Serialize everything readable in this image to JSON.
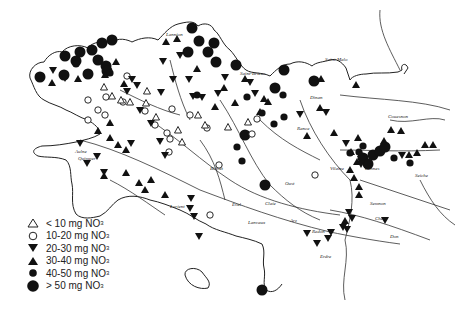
{
  "legend": {
    "items": [
      {
        "symbol": "triangle-open",
        "label": "< 10 mg NO",
        "sub": "3"
      },
      {
        "symbol": "circle-open",
        "label": "10-20 mg NO",
        "sub": "3"
      },
      {
        "symbol": "triangle-down-filled",
        "label": "20-30 mg NO",
        "sub": "3"
      },
      {
        "symbol": "triangle-up-filled",
        "label": "30-40 mg NO",
        "sub": "3"
      },
      {
        "symbol": "circle-small-filled",
        "label": "40-50 mg NO",
        "sub": "3"
      },
      {
        "symbol": "circle-large-filled",
        "label": "> 50 mg NO",
        "sub": "3"
      }
    ]
  },
  "map": {
    "river_labels": [
      {
        "text": "Lannion",
        "x": 166,
        "y": 36
      },
      {
        "text": "Saint-Brieuc",
        "x": 240,
        "y": 75
      },
      {
        "text": "Saint-Malo",
        "x": 325,
        "y": 61
      },
      {
        "text": "Dinan",
        "x": 310,
        "y": 99
      },
      {
        "text": "Rance",
        "x": 297,
        "y": 130
      },
      {
        "text": "Aulne",
        "x": 75,
        "y": 153
      },
      {
        "text": "Quimper",
        "x": 78,
        "y": 160
      },
      {
        "text": "Blavet",
        "x": 210,
        "y": 170
      },
      {
        "text": "Oust",
        "x": 285,
        "y": 185
      },
      {
        "text": "Vilaine",
        "x": 330,
        "y": 170
      },
      {
        "text": "Rennes",
        "x": 365,
        "y": 170
      },
      {
        "text": "Seiche",
        "x": 415,
        "y": 177
      },
      {
        "text": "Semnon",
        "x": 370,
        "y": 205
      },
      {
        "text": "Chère",
        "x": 375,
        "y": 220
      },
      {
        "text": "Don",
        "x": 390,
        "y": 238
      },
      {
        "text": "Erdre",
        "x": 320,
        "y": 258
      },
      {
        "text": "Claie",
        "x": 265,
        "y": 205
      },
      {
        "text": "Arz",
        "x": 290,
        "y": 222
      },
      {
        "text": "Redon",
        "x": 312,
        "y": 233
      },
      {
        "text": "Evel",
        "x": 232,
        "y": 206
      },
      {
        "text": "Lanvaux",
        "x": 248,
        "y": 224
      },
      {
        "text": "Lorient",
        "x": 170,
        "y": 208
      },
      {
        "text": "Couesnon",
        "x": 388,
        "y": 118
      }
    ],
    "symbols": {
      "large_circles": [
        [
          40,
          77
        ],
        [
          65,
          56
        ],
        [
          64,
          75
        ],
        [
          76,
          61
        ],
        [
          80,
          52
        ],
        [
          92,
          50
        ],
        [
          98,
          60
        ],
        [
          102,
          43
        ],
        [
          88,
          74
        ],
        [
          106,
          66
        ],
        [
          112,
          40
        ],
        [
          107,
          71
        ],
        [
          192,
          28
        ],
        [
          199,
          41
        ],
        [
          188,
          52
        ],
        [
          214,
          43
        ],
        [
          208,
          52
        ],
        [
          216,
          62
        ],
        [
          236,
          65
        ],
        [
          284,
          70
        ],
        [
          275,
          88
        ],
        [
          314,
          81
        ],
        [
          245,
          135
        ],
        [
          265,
          185
        ],
        [
          262,
          290
        ],
        [
          363,
          158
        ],
        [
          373,
          155
        ],
        [
          368,
          164
        ],
        [
          380,
          151
        ],
        [
          385,
          147
        ]
      ],
      "small_circles": [
        [
          76,
          64
        ],
        [
          110,
          73
        ],
        [
          197,
          95
        ],
        [
          247,
          97
        ],
        [
          283,
          95
        ],
        [
          284,
          117
        ],
        [
          237,
          147
        ],
        [
          242,
          161
        ],
        [
          274,
          124
        ],
        [
          262,
          113
        ],
        [
          359,
          152
        ],
        [
          394,
          158
        ],
        [
          410,
          163
        ],
        [
          350,
          153
        ],
        [
          363,
          146
        ]
      ],
      "open_circles": [
        [
          88,
          100
        ],
        [
          105,
          115
        ],
        [
          88,
          120
        ],
        [
          98,
          110
        ],
        [
          123,
          102
        ],
        [
          145,
          111
        ],
        [
          167,
          133
        ],
        [
          155,
          125
        ],
        [
          172,
          109
        ],
        [
          190,
          115
        ],
        [
          207,
          128
        ],
        [
          170,
          139
        ],
        [
          169,
          152
        ],
        [
          219,
          165
        ],
        [
          210,
          215
        ],
        [
          257,
          119
        ],
        [
          252,
          134
        ],
        [
          127,
          76
        ],
        [
          106,
          97
        ],
        [
          315,
          175
        ]
      ],
      "open_triangles": [
        [
          104,
          87
        ],
        [
          112,
          96
        ],
        [
          121,
          100
        ],
        [
          130,
          102
        ],
        [
          147,
          91
        ],
        [
          146,
          103
        ],
        [
          156,
          117
        ],
        [
          198,
          115
        ],
        [
          178,
          130
        ],
        [
          182,
          142
        ],
        [
          205,
          125
        ],
        [
          248,
          122
        ],
        [
          228,
          127
        ]
      ],
      "up_triangles": [
        [
          52,
          83
        ],
        [
          78,
          79
        ],
        [
          105,
          75
        ],
        [
          116,
          62
        ],
        [
          124,
          84
        ],
        [
          166,
          42
        ],
        [
          177,
          39
        ],
        [
          197,
          69
        ],
        [
          224,
          88
        ],
        [
          245,
          79
        ],
        [
          268,
          102
        ],
        [
          321,
          79
        ],
        [
          356,
          85
        ],
        [
          320,
          108
        ],
        [
          260,
          112
        ],
        [
          307,
          136
        ],
        [
          110,
          123
        ],
        [
          98,
          131
        ],
        [
          118,
          145
        ],
        [
          110,
          138
        ],
        [
          126,
          150
        ],
        [
          126,
          173
        ],
        [
          104,
          176
        ],
        [
          139,
          183
        ],
        [
          151,
          180
        ],
        [
          145,
          190
        ],
        [
          165,
          195
        ],
        [
          215,
          107
        ],
        [
          235,
          103
        ],
        [
          264,
          99
        ],
        [
          334,
          133
        ],
        [
          358,
          138
        ],
        [
          384,
          141
        ],
        [
          391,
          130
        ],
        [
          401,
          131
        ],
        [
          357,
          162
        ],
        [
          409,
          155
        ],
        [
          417,
          153
        ],
        [
          425,
          145
        ],
        [
          433,
          145
        ],
        [
          351,
          152
        ],
        [
          361,
          154
        ],
        [
          350,
          170
        ],
        [
          354,
          178
        ],
        [
          359,
          187
        ],
        [
          359,
          195
        ],
        [
          345,
          221
        ]
      ],
      "down_triangles": [
        [
          53,
          70
        ],
        [
          65,
          78
        ],
        [
          127,
          91
        ],
        [
          132,
          79
        ],
        [
          137,
          85
        ],
        [
          140,
          110
        ],
        [
          151,
          123
        ],
        [
          163,
          61
        ],
        [
          161,
          92
        ],
        [
          173,
          79
        ],
        [
          180,
          55
        ],
        [
          189,
          79
        ],
        [
          193,
          96
        ],
        [
          202,
          97
        ],
        [
          218,
          93
        ],
        [
          225,
          77
        ],
        [
          250,
          82
        ],
        [
          255,
          93
        ],
        [
          300,
          114
        ],
        [
          326,
          112
        ],
        [
          80,
          143
        ],
        [
          97,
          156
        ],
        [
          104,
          172
        ],
        [
          87,
          163
        ],
        [
          131,
          143
        ],
        [
          160,
          141
        ],
        [
          165,
          155
        ],
        [
          191,
          198
        ],
        [
          190,
          208
        ],
        [
          194,
          216
        ],
        [
          199,
          236
        ],
        [
          346,
          143
        ],
        [
          402,
          155
        ],
        [
          361,
          164
        ],
        [
          349,
          212
        ],
        [
          352,
          218
        ],
        [
          343,
          227
        ],
        [
          307,
          233
        ],
        [
          328,
          238
        ],
        [
          317,
          243
        ],
        [
          347,
          229
        ],
        [
          331,
          232
        ],
        [
          385,
          220
        ]
      ]
    }
  }
}
